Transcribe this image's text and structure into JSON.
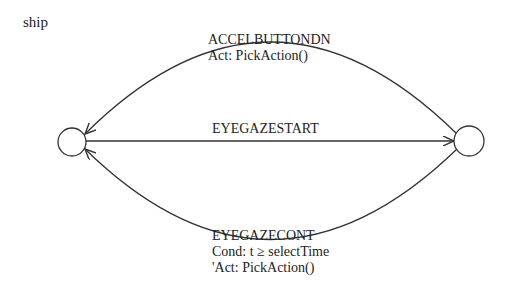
{
  "diagram": {
    "title": "ship",
    "states": [
      {
        "id": "left-state",
        "cx": 72,
        "cy": 142,
        "r": 14
      },
      {
        "id": "right-state",
        "cx": 469,
        "cy": 141,
        "r": 15
      }
    ],
    "transitions": [
      {
        "id": "top",
        "event": "ACCELBUTTONDN",
        "action": "Act: PickAction()",
        "from": "right-state",
        "to": "left-state"
      },
      {
        "id": "middle",
        "event": "EYEGAZESTART",
        "from": "left-state",
        "to": "right-state"
      },
      {
        "id": "bottom",
        "event": "EYEGAZECONT",
        "condition": "Cond: t ≥ selectTime",
        "action": "'Act: PickAction()",
        "from": "right-state",
        "to": "left-state"
      }
    ],
    "colors": {
      "stroke": "#333333",
      "text": "#222222",
      "background": "#ffffff"
    }
  }
}
